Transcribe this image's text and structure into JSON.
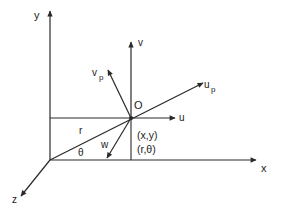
{
  "diagram": {
    "type": "vector-coordinate-diagram",
    "colors": {
      "stroke": "#2a2a2a",
      "background": "#ffffff"
    },
    "axes": {
      "x_label": "x",
      "y_label": "y",
      "z_label": "z"
    },
    "point": {
      "name_label": "O",
      "cartesian_label": "(x,y)",
      "polar_label": "(r,θ)"
    },
    "vectors": {
      "u_label": "u",
      "v_label": "v",
      "w_label": "w",
      "up_main": "u",
      "up_sub": "p",
      "vp_main": "v",
      "vp_sub": "p"
    },
    "radius_label": "r",
    "angle_label": "θ"
  }
}
